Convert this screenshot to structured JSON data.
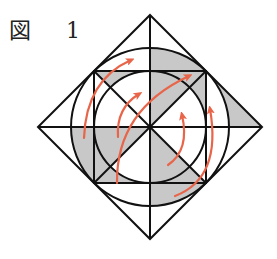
{
  "figure": {
    "label": "図 1",
    "colors": {
      "line": "#111111",
      "shade": "#c8c8c8",
      "arrow": "#e8654a",
      "background": "#ffffff"
    },
    "geometry": {
      "center": [
        150,
        127
      ],
      "diamond_half_diagonal": 112,
      "outer_circle_radius": 79,
      "inner_square_half_side": 56,
      "inner_circle_radius": 56
    },
    "arrows": [
      {
        "name": "arrow-outer-left",
        "from": [
          84,
          138
        ],
        "to": [
          133,
          59
        ]
      },
      {
        "name": "arrow-inner-left",
        "from": [
          118,
          137
        ],
        "to": [
          140,
          93
        ]
      },
      {
        "name": "arrow-long-diagonal",
        "from": [
          117,
          183
        ],
        "to": [
          191,
          75
        ]
      },
      {
        "name": "arrow-inner-right",
        "from": [
          168,
          165
        ],
        "to": [
          182,
          113
        ]
      },
      {
        "name": "arrow-outer-right",
        "from": [
          175,
          196
        ],
        "to": [
          210,
          107
        ]
      }
    ]
  }
}
